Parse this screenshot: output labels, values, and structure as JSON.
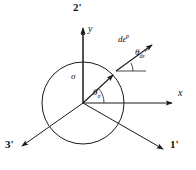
{
  "figure": {
    "type": "deviatoric-plane-diagram",
    "stroke_color": "#1a1a1a",
    "background_color": "#ffffff"
  },
  "axes": {
    "principal": [
      {
        "name": "axis-1-prime",
        "label": "1'",
        "angle_deg": -30,
        "label_x": 170,
        "label_y": 143
      },
      {
        "name": "axis-2-prime",
        "label": "2'",
        "angle_deg": 90,
        "label_x": 73,
        "label_y": 2
      },
      {
        "name": "axis-3-prime",
        "label": "3'",
        "angle_deg": 210,
        "label_x": 6,
        "label_y": 143
      }
    ],
    "cartesian": [
      {
        "name": "axis-x",
        "label": "x",
        "angle_deg": 0,
        "label_x": 178,
        "label_y": 87
      },
      {
        "name": "axis-y",
        "label": "y",
        "angle_deg": 90,
        "label_x": 88,
        "label_y": 22
      }
    ]
  },
  "circle": {
    "name": "yield-circle",
    "center_x": 83,
    "center_y": 103,
    "radius": 41
  },
  "vectors": [
    {
      "name": "stress-vector",
      "label": "σ",
      "label_x": 72,
      "label_y": 73,
      "angle_deg": 43,
      "length": 41
    },
    {
      "name": "plastic-strain-increment-vector",
      "label_base": "dε",
      "label_sup": "p",
      "label_x": 119,
      "label_y": 33,
      "angle_deg": 43,
      "length": 45
    }
  ],
  "angles": [
    {
      "name": "theta-sigma",
      "base": "θ",
      "sub": "σ",
      "value_deg": 43,
      "label_x": 94,
      "label_y": 92
    },
    {
      "name": "theta-d-epsilon-p",
      "base": "θ",
      "sub": "dε",
      "sub_sup": "p",
      "value_deg": 28,
      "label_x": 136,
      "label_y": 50
    }
  ]
}
